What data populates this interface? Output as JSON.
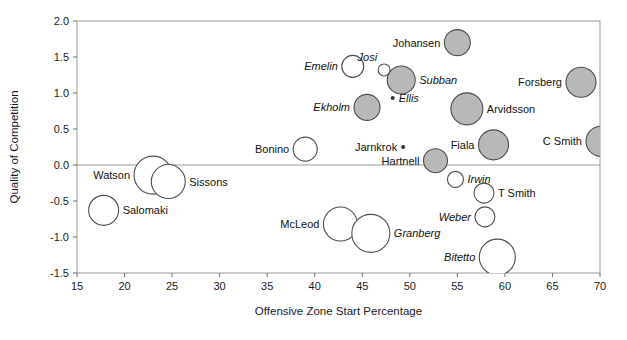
{
  "chart_data": {
    "type": "scatter",
    "title": "",
    "xlabel": "Offensive Zone Start Percentage",
    "ylabel": "Quality of Competition",
    "xlim": [
      15,
      70
    ],
    "ylim": [
      -1.5,
      2.0
    ],
    "xticks": [
      "15",
      "20",
      "25",
      "30",
      "35",
      "40",
      "45",
      "50",
      "55",
      "60",
      "65",
      "70"
    ],
    "yticks": [
      "2.0",
      "1.5",
      "1.0",
      "0.5",
      "0.0",
      "-0.5",
      "-1.0",
      "-1.5"
    ],
    "grid": false,
    "legend": "none",
    "zero_line": 0.0,
    "size_encoding": "bubble-area",
    "fill_groups": {
      "filled": "#b8b8b8",
      "open": "#ffffff"
    },
    "points": [
      {
        "name": "Johansen",
        "x": 55.0,
        "y": 1.7,
        "r": 13,
        "fill": "filled",
        "label_side": "left",
        "italic": false
      },
      {
        "name": "Josi",
        "x": 47.3,
        "y": 1.32,
        "r": 6,
        "fill": "open",
        "label_side": "above",
        "italic": true
      },
      {
        "name": "Emelin",
        "x": 44.0,
        "y": 1.37,
        "r": 11,
        "fill": "open",
        "label_side": "left",
        "italic": true
      },
      {
        "name": "Subban",
        "x": 49.1,
        "y": 1.18,
        "r": 14,
        "fill": "filled",
        "label_side": "right",
        "italic": true
      },
      {
        "name": "Forsberg",
        "x": 68.0,
        "y": 1.15,
        "r": 15,
        "fill": "filled",
        "label_side": "left",
        "italic": false
      },
      {
        "name": "Ellis",
        "x": 48.2,
        "y": 0.93,
        "r": 2,
        "fill": "dot",
        "label_side": "right",
        "italic": true
      },
      {
        "name": "Ekholm",
        "x": 45.5,
        "y": 0.8,
        "r": 13,
        "fill": "filled",
        "label_side": "left",
        "italic": true
      },
      {
        "name": "Arvidsson",
        "x": 56.0,
        "y": 0.78,
        "r": 16,
        "fill": "filled",
        "label_side": "right",
        "italic": false
      },
      {
        "name": "C Smith",
        "x": 70.1,
        "y": 0.33,
        "r": 15,
        "fill": "filled",
        "label_side": "left",
        "italic": false
      },
      {
        "name": "Fiala",
        "x": 58.8,
        "y": 0.28,
        "r": 15,
        "fill": "filled",
        "label_side": "left",
        "italic": false
      },
      {
        "name": "Bonino",
        "x": 39.0,
        "y": 0.22,
        "r": 12,
        "fill": "open",
        "label_side": "left",
        "italic": false
      },
      {
        "name": "Jarnkrok",
        "x": 49.3,
        "y": 0.25,
        "r": 2,
        "fill": "dot",
        "label_side": "left",
        "italic": false
      },
      {
        "name": "Hartnell",
        "x": 52.7,
        "y": 0.06,
        "r": 12,
        "fill": "filled",
        "label_side": "left",
        "italic": false
      },
      {
        "name": "Watson",
        "x": 23.0,
        "y": -0.14,
        "r": 19,
        "fill": "open",
        "label_side": "left",
        "italic": false
      },
      {
        "name": "Sissons",
        "x": 24.6,
        "y": -0.23,
        "r": 17,
        "fill": "open",
        "label_side": "right",
        "italic": false
      },
      {
        "name": "Irwin",
        "x": 54.8,
        "y": -0.2,
        "r": 8,
        "fill": "open",
        "label_side": "right",
        "italic": true
      },
      {
        "name": "T Smith",
        "x": 57.8,
        "y": -0.39,
        "r": 10,
        "fill": "open",
        "label_side": "right",
        "italic": false
      },
      {
        "name": "Salomaki",
        "x": 17.8,
        "y": -0.63,
        "r": 15,
        "fill": "open",
        "label_side": "right",
        "italic": false
      },
      {
        "name": "Weber",
        "x": 57.9,
        "y": -0.72,
        "r": 10,
        "fill": "open",
        "label_side": "left",
        "italic": true
      },
      {
        "name": "McLeod",
        "x": 42.7,
        "y": -0.82,
        "r": 17,
        "fill": "open",
        "label_side": "left",
        "italic": false
      },
      {
        "name": "Granberg",
        "x": 45.9,
        "y": -0.95,
        "r": 19,
        "fill": "open",
        "label_side": "right",
        "italic": true
      },
      {
        "name": "Bitetto",
        "x": 59.2,
        "y": -1.28,
        "r": 18,
        "fill": "open",
        "label_side": "left",
        "italic": true
      }
    ]
  }
}
